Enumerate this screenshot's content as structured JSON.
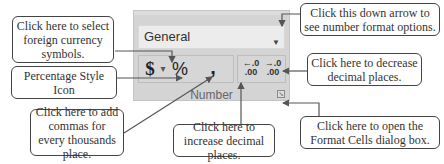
{
  "ribbon_group": {
    "title": "Number",
    "format_dropdown": {
      "value": "General",
      "arrow_icon": "chevron-down-icon"
    },
    "buttons": {
      "currency": "$",
      "currency_dropdown": "▾",
      "percent": "%",
      "comma": ",",
      "increase_decimal_top": "←.0",
      "increase_decimal_bottom": ".00",
      "decrease_decimal_top": "→.0",
      "decrease_decimal_bottom": ".00",
      "dialog_launcher": "↘"
    }
  },
  "callouts": {
    "currency": "Click here to select foreign currency symbols.",
    "percent": "Percentage Style Icon",
    "comma": "Click here to add commas for every thousands place.",
    "increase_decimal": "Click here to increase decimal places.",
    "format_dropdown": "Click this down arrow to see number format options.",
    "decrease_decimal": "Click here to decrease decimal places.",
    "dialog_launcher": "Click here to open the Format Cells dialog box."
  }
}
